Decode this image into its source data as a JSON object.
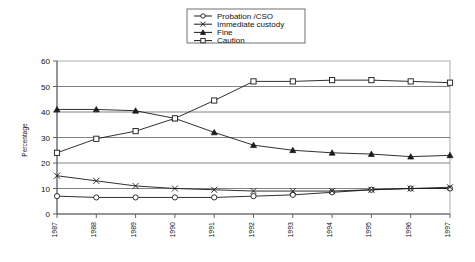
{
  "chart_data": {
    "type": "line",
    "title": "",
    "xlabel": "",
    "ylabel": "Percentage",
    "x": [
      1987,
      1988,
      1989,
      1990,
      1991,
      1992,
      1993,
      1994,
      1995,
      1996,
      1997
    ],
    "categories": [
      "1987",
      "1988",
      "1989",
      "1990",
      "1991",
      "1992",
      "1993",
      "1994",
      "1995",
      "1996",
      "1997"
    ],
    "xlim": [
      1987,
      1997
    ],
    "ylim": [
      0,
      60
    ],
    "yticks": [
      0,
      10,
      20,
      30,
      40,
      50,
      60
    ],
    "grid": true,
    "legend_position": "top-center",
    "series": [
      {
        "name": "Probation /CSO",
        "marker": "circle-open",
        "values": [
          7,
          6.5,
          6.5,
          6.5,
          6.5,
          7,
          7.5,
          8.5,
          9.5,
          10,
          10
        ]
      },
      {
        "name": "Immediate custody",
        "marker": "cross",
        "values": [
          15,
          13,
          11,
          10,
          9.5,
          9,
          9,
          9,
          9.5,
          10,
          10.5
        ]
      },
      {
        "name": "Fine",
        "marker": "triangle-filled",
        "values": [
          41,
          41,
          40.5,
          37.5,
          32,
          27,
          25,
          24,
          23.5,
          22.5,
          23
        ]
      },
      {
        "name": "Caution",
        "marker": "square-open",
        "values": [
          24,
          29.5,
          32.5,
          37.5,
          44.5,
          52,
          52,
          52.5,
          52.5,
          52,
          51.5
        ]
      }
    ]
  },
  "legend": {
    "entries": [
      {
        "label": "Probation /CSO"
      },
      {
        "label": "Immediate custody"
      },
      {
        "label": "Fine"
      },
      {
        "label": "Caution"
      }
    ]
  },
  "axes": {
    "y_title": "Percentage",
    "y_tick_labels": [
      "60",
      "50",
      "40",
      "30",
      "20",
      "10",
      "0"
    ],
    "x_tick_labels": [
      "1987",
      "1988",
      "1989",
      "1990",
      "1991",
      "1992",
      "1993",
      "1994",
      "1995",
      "1996",
      "1997"
    ]
  }
}
